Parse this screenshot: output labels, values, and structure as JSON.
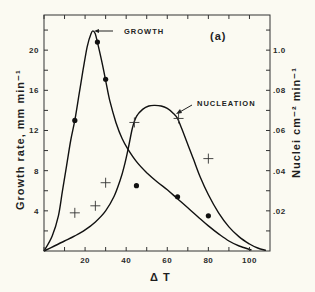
{
  "chart_data": {
    "type": "line",
    "title": "",
    "panel_label": "(a)",
    "xlabel": "Δ T",
    "ylabel": "Growth rate,  mm  min⁻¹",
    "ylabel_right": "Nuclei cm⁻² min⁻¹",
    "xlim": [
      0,
      110
    ],
    "ylim": [
      0,
      23.5
    ],
    "ylim_right": [
      0,
      0.1175
    ],
    "x_ticks": [
      0,
      10,
      20,
      30,
      40,
      50,
      60,
      70,
      80,
      90,
      100
    ],
    "x_tick_labels": [
      {
        "value": 20,
        "label": "20"
      },
      {
        "value": 40,
        "label": "40"
      },
      {
        "value": 60,
        "label": "60"
      },
      {
        "value": 80,
        "label": "80"
      },
      {
        "value": 100,
        "label": "100"
      }
    ],
    "y_ticks": [
      2,
      4,
      6,
      8,
      10,
      12,
      14,
      16,
      18,
      20,
      22
    ],
    "y_tick_labels": [
      {
        "value": 4,
        "label": "4"
      },
      {
        "value": 8,
        "label": "8"
      },
      {
        "value": 12,
        "label": "12"
      },
      {
        "value": 16,
        "label": "16"
      },
      {
        "value": 20,
        "label": "20"
      }
    ],
    "y_right_ticks": [
      0.01,
      0.02,
      0.03,
      0.04,
      0.05,
      0.06,
      0.07,
      0.08,
      0.09,
      0.1,
      0.11
    ],
    "y_right_tick_labels": [
      {
        "value": 0.02,
        "label": ".02"
      },
      {
        "value": 0.04,
        "label": ".04"
      },
      {
        "value": 0.06,
        "label": ".06"
      },
      {
        "value": 0.08,
        "label": ".08"
      },
      {
        "value": 0.1,
        "label": "1.0"
      }
    ],
    "series": [
      {
        "name": "GROWTH",
        "axis": "left",
        "curve": [
          [
            0,
            0
          ],
          [
            4,
            1.5
          ],
          [
            7,
            3.5
          ],
          [
            9,
            6
          ],
          [
            11,
            8.5
          ],
          [
            13,
            11
          ],
          [
            15,
            13
          ],
          [
            17,
            15.5
          ],
          [
            19,
            18
          ],
          [
            21,
            20.3
          ],
          [
            23,
            21.7
          ],
          [
            24,
            21.9
          ],
          [
            25,
            21.6
          ],
          [
            26,
            20.8
          ],
          [
            28,
            19
          ],
          [
            30,
            17
          ],
          [
            32,
            15
          ],
          [
            35,
            12.8
          ],
          [
            38,
            11.2
          ],
          [
            41,
            10.1
          ],
          [
            45,
            8.9
          ],
          [
            50,
            7.8
          ],
          [
            55,
            6.9
          ],
          [
            60,
            6.1
          ],
          [
            65,
            5.2
          ],
          [
            70,
            4.3
          ],
          [
            75,
            3.4
          ],
          [
            80,
            2.5
          ],
          [
            85,
            1.7
          ],
          [
            90,
            1.0
          ],
          [
            95,
            0.5
          ],
          [
            101,
            0.1
          ]
        ],
        "points": [
          [
            15,
            13
          ],
          [
            26,
            20.8
          ],
          [
            30,
            17.1
          ],
          [
            45,
            6.5
          ],
          [
            65,
            5.4
          ],
          [
            80,
            3.5
          ]
        ],
        "marker": "dot"
      },
      {
        "name": "NUCLEATION",
        "axis": "right",
        "curve": [
          [
            0,
            0
          ],
          [
            5,
            0.0025
          ],
          [
            10,
            0.005
          ],
          [
            15,
            0.0075
          ],
          [
            20,
            0.0105
          ],
          [
            25,
            0.0145
          ],
          [
            30,
            0.02
          ],
          [
            34,
            0.027
          ],
          [
            37,
            0.035
          ],
          [
            39,
            0.042
          ],
          [
            41,
            0.051
          ],
          [
            43,
            0.061
          ],
          [
            45,
            0.067
          ],
          [
            48,
            0.0705
          ],
          [
            51,
            0.0722
          ],
          [
            54,
            0.0725
          ],
          [
            57,
            0.0722
          ],
          [
            60,
            0.071
          ],
          [
            63,
            0.0685
          ],
          [
            65,
            0.066
          ],
          [
            67,
            0.061
          ],
          [
            70,
            0.053
          ],
          [
            73,
            0.045
          ],
          [
            76,
            0.037
          ],
          [
            80,
            0.028
          ],
          [
            85,
            0.019
          ],
          [
            90,
            0.012
          ],
          [
            95,
            0.007
          ],
          [
            100,
            0.0035
          ],
          [
            104,
            0.0015
          ],
          [
            108,
            0.0003
          ]
        ],
        "points": [
          [
            15,
            0.019
          ],
          [
            25,
            0.0225
          ],
          [
            30,
            0.034
          ],
          [
            44,
            0.064
          ],
          [
            65.5,
            0.066
          ],
          [
            80,
            0.046
          ]
        ],
        "marker": "plus"
      }
    ],
    "annotations": [
      {
        "text": "GROWTH",
        "points_to_series": "GROWTH"
      },
      {
        "text": "NUCLEATION",
        "points_to_series": "NUCLEATION"
      }
    ],
    "grid": false,
    "legend": "none"
  }
}
